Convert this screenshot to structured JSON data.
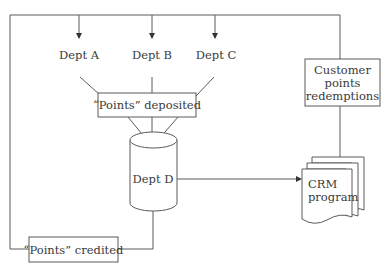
{
  "diagram": {
    "nodes": {
      "dept_a": "Dept A",
      "dept_b": "Dept B",
      "dept_c": "Dept C",
      "points_deposited": "“Points” deposited",
      "dept_d": "Dept D",
      "customer_line1": "Customer",
      "customer_line2": "points",
      "customer_line3": "redemptions",
      "crm_line1": "CRM",
      "crm_line2": "program",
      "points_credited": "“Points” credited"
    },
    "edges": [
      {
        "from": "top-bus",
        "to": "dept_a"
      },
      {
        "from": "top-bus",
        "to": "dept_b"
      },
      {
        "from": "top-bus",
        "to": "dept_c"
      },
      {
        "from": "dept_a",
        "to": "points_deposited"
      },
      {
        "from": "dept_b",
        "to": "points_deposited"
      },
      {
        "from": "dept_c",
        "to": "points_deposited"
      },
      {
        "from": "points_deposited",
        "to": "dept_d"
      },
      {
        "from": "dept_d",
        "to": "crm_program"
      },
      {
        "from": "crm_program",
        "to": "customer_points_redemptions"
      },
      {
        "from": "customer_points_redemptions",
        "to": "top-bus"
      },
      {
        "from": "dept_d",
        "to": "points_credited"
      },
      {
        "from": "points_credited",
        "to": "top-bus"
      }
    ],
    "colors": {
      "stroke": "#5a5a5a",
      "text": "#3a3a3a",
      "background": "#ffffff"
    }
  }
}
